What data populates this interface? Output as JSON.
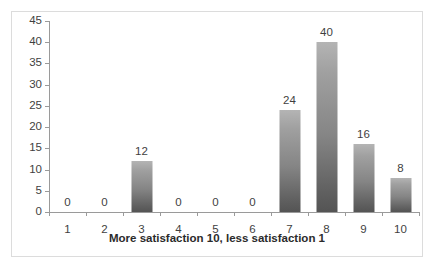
{
  "chart_data": {
    "type": "bar",
    "title": "",
    "xlabel": "More satisfaction 10, less satisfaction 1",
    "ylabel": "",
    "categories": [
      "1",
      "2",
      "3",
      "4",
      "5",
      "6",
      "7",
      "8",
      "9",
      "10"
    ],
    "values": [
      0,
      0,
      12,
      0,
      0,
      0,
      24,
      40,
      16,
      8
    ],
    "data_labels": [
      "0",
      "0",
      "12",
      "0",
      "0",
      "0",
      "24",
      "40",
      "16",
      "8"
    ],
    "ylim": [
      0,
      45
    ],
    "ytick_labels": [
      "0",
      "5",
      "10",
      "15",
      "20",
      "25",
      "30",
      "35",
      "40",
      "45"
    ],
    "ytick_values": [
      0,
      5,
      10,
      15,
      20,
      25,
      30,
      35,
      40,
      45
    ],
    "grid": false,
    "legend": false,
    "legend_position": "none",
    "bar_color_top": "#b4b4b4",
    "bar_color_bottom": "#545454",
    "axis_color": "#9a9a9a",
    "text_color": "#3f3f3f",
    "frame_color": "#dcdcdc",
    "background": "#ffffff"
  }
}
